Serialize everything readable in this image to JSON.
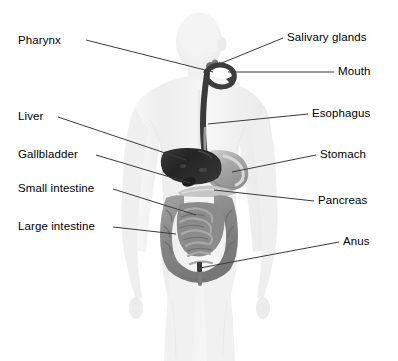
{
  "diagram": {
    "background_color": "#ffffff",
    "label_color": "#000000",
    "leader_line_color": "#3b3b3b",
    "body_silhouette_color": "#f2f2f2",
    "organ_colors": {
      "liver": "#2c2c2c",
      "gallbladder": "#1e1e1e",
      "stomach": "#b9b9b9",
      "pancreas": "#c9c9c9",
      "esophagus": "#3a3a3a",
      "small_intestine": "#8d8d8d",
      "large_intestine": "#9a9a9a",
      "mouth": "#555555",
      "salivary_glands": "#6a6a6a",
      "anus": "#3a3a3a"
    },
    "labels": [
      {
        "id": "pharynx",
        "text": "Pharynx",
        "side": "left",
        "text_x": 18,
        "text_y": 34,
        "leader": {
          "x1": 86,
          "y1": 40,
          "x2": 213,
          "y2": 72
        }
      },
      {
        "id": "liver",
        "text": "Liver",
        "side": "left",
        "text_x": 18,
        "text_y": 110,
        "leader": {
          "x1": 58,
          "y1": 117,
          "x2": 186,
          "y2": 160
        }
      },
      {
        "id": "gallbladder",
        "text": "Gallbladder",
        "side": "left",
        "text_x": 18,
        "text_y": 148,
        "leader": {
          "x1": 96,
          "y1": 155,
          "x2": 190,
          "y2": 183
        }
      },
      {
        "id": "small-intestine",
        "text": "Small intestine",
        "side": "left",
        "text_x": 18,
        "text_y": 182,
        "leader": {
          "x1": 113,
          "y1": 189,
          "x2": 196,
          "y2": 215
        }
      },
      {
        "id": "large-intestine",
        "text": "Large intestine",
        "side": "left",
        "text_x": 18,
        "text_y": 220,
        "leader": {
          "x1": 113,
          "y1": 227,
          "x2": 176,
          "y2": 234
        }
      },
      {
        "id": "salivary-glands",
        "text": "Salivary glands",
        "side": "right",
        "text_x": 287,
        "text_y": 31,
        "leader": {
          "x1": 283,
          "y1": 38,
          "x2": 212,
          "y2": 67
        }
      },
      {
        "id": "mouth",
        "text": "Mouth",
        "side": "right",
        "text_x": 338,
        "text_y": 65,
        "leader": {
          "x1": 334,
          "y1": 72,
          "x2": 228,
          "y2": 72
        }
      },
      {
        "id": "esophagus",
        "text": "Esophagus",
        "side": "right",
        "text_x": 312,
        "text_y": 107,
        "leader": {
          "x1": 308,
          "y1": 114,
          "x2": 208,
          "y2": 124
        }
      },
      {
        "id": "stomach",
        "text": "Stomach",
        "side": "right",
        "text_x": 320,
        "text_y": 148,
        "leader": {
          "x1": 316,
          "y1": 155,
          "x2": 232,
          "y2": 172
        }
      },
      {
        "id": "pancreas",
        "text": "Pancreas",
        "side": "right",
        "text_x": 318,
        "text_y": 194,
        "leader": {
          "x1": 314,
          "y1": 201,
          "x2": 214,
          "y2": 190
        }
      },
      {
        "id": "anus",
        "text": "Anus",
        "side": "right",
        "text_x": 343,
        "text_y": 235,
        "leader": {
          "x1": 339,
          "y1": 242,
          "x2": 200,
          "y2": 268
        }
      }
    ]
  }
}
